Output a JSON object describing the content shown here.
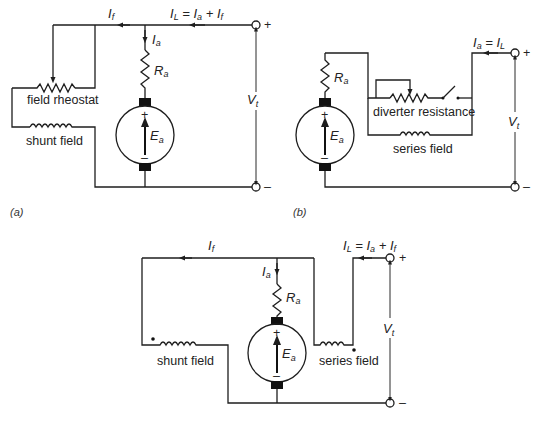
{
  "diagrams": {
    "a": {
      "caption": "(a)",
      "labels": {
        "field_current": "I",
        "field_current_sub": "f",
        "load_eq_lhs": "I",
        "load_eq_lhs_sub": "L",
        "load_eq_mid": " = I",
        "load_eq_mid_sub": "a",
        "load_eq_plus": " + I",
        "load_eq_plus_sub": "f",
        "armature_current": "I",
        "armature_current_sub": "a",
        "armature_resistance": "R",
        "armature_resistance_sub": "a",
        "emf": "E",
        "emf_sub": "a",
        "terminal_voltage": "V",
        "terminal_voltage_sub": "t",
        "rheostat": "field rheostat",
        "shunt": "shunt field",
        "plus": "+",
        "minus": "–"
      }
    },
    "b": {
      "caption": "(b)",
      "labels": {
        "load_eq_lhs": "I",
        "load_eq_lhs_sub": "a",
        "load_eq_rhs": " = I",
        "load_eq_rhs_sub": "L",
        "armature_resistance": "R",
        "armature_resistance_sub": "a",
        "emf": "E",
        "emf_sub": "a",
        "terminal_voltage": "V",
        "terminal_voltage_sub": "t",
        "diverter": "diverter resistance",
        "series": "series field",
        "plus": "+",
        "minus": "–"
      }
    },
    "c": {
      "caption": "(c)",
      "labels": {
        "field_current": "I",
        "field_current_sub": "f",
        "load_eq_lhs": "I",
        "load_eq_lhs_sub": "L",
        "load_eq_mid": " = I",
        "load_eq_mid_sub": "a",
        "load_eq_plus": " + I",
        "load_eq_plus_sub": "f",
        "armature_current": "I",
        "armature_current_sub": "a",
        "armature_resistance": "R",
        "armature_resistance_sub": "a",
        "emf": "E",
        "emf_sub": "a",
        "terminal_voltage": "V",
        "terminal_voltage_sub": "t",
        "shunt": "shunt field",
        "series": "series field",
        "plus": "+",
        "minus": "–"
      }
    }
  },
  "colors": {
    "ink": "#1e1e1e",
    "background": "#ffffff"
  }
}
